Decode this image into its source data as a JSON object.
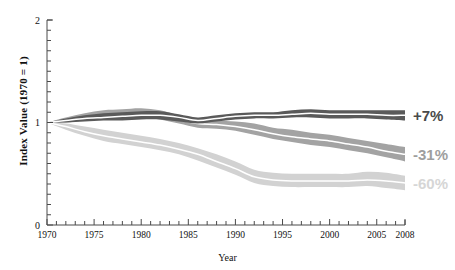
{
  "chart_data": {
    "type": "area",
    "title": "",
    "xlabel": "Year",
    "ylabel": "Index Value (1970 = 1)",
    "xlim": [
      1970,
      2008
    ],
    "ylim": [
      0,
      2
    ],
    "ytick_labels": [
      "0",
      "1",
      "2"
    ],
    "ytick_values": [
      0,
      1,
      2
    ],
    "yminor_step": 0.1,
    "xtick_labels": [
      "1970",
      "1975",
      "1980",
      "1985",
      "1990",
      "1995",
      "2000",
      "2005",
      "2008"
    ],
    "xtick_values": [
      1970,
      1975,
      1980,
      1985,
      1990,
      1995,
      2000,
      2005,
      2008
    ],
    "xminor_step": 1,
    "grid": false,
    "legend_position": "right-inline-end-labels",
    "x": [
      1970,
      1972,
      1974,
      1976,
      1978,
      1980,
      1982,
      1984,
      1986,
      1988,
      1990,
      1992,
      1994,
      1996,
      1998,
      2000,
      2002,
      2004,
      2006,
      2008
    ],
    "series": [
      {
        "name": "+7%",
        "end_label": "+7%",
        "color": "#555555",
        "band_color": "#5a5a5a",
        "center": [
          1.0,
          1.02,
          1.04,
          1.05,
          1.06,
          1.07,
          1.07,
          1.05,
          1.02,
          1.04,
          1.06,
          1.07,
          1.07,
          1.08,
          1.09,
          1.08,
          1.08,
          1.08,
          1.07,
          1.07
        ],
        "upper": [
          1.0,
          1.04,
          1.07,
          1.09,
          1.1,
          1.11,
          1.11,
          1.08,
          1.05,
          1.07,
          1.09,
          1.1,
          1.1,
          1.12,
          1.13,
          1.12,
          1.12,
          1.12,
          1.12,
          1.12
        ],
        "lower": [
          1.0,
          1.0,
          1.01,
          1.02,
          1.02,
          1.03,
          1.03,
          1.01,
          0.99,
          1.01,
          1.03,
          1.04,
          1.04,
          1.05,
          1.05,
          1.04,
          1.04,
          1.04,
          1.03,
          1.02
        ]
      },
      {
        "name": "-31%",
        "end_label": "-31%",
        "color": "#9a9a9a",
        "band_color": "#a3a3a3",
        "center": [
          1.0,
          1.02,
          1.05,
          1.07,
          1.08,
          1.09,
          1.07,
          1.03,
          0.99,
          0.98,
          0.96,
          0.93,
          0.89,
          0.86,
          0.84,
          0.82,
          0.79,
          0.76,
          0.72,
          0.69
        ],
        "upper": [
          1.0,
          1.05,
          1.09,
          1.12,
          1.13,
          1.14,
          1.12,
          1.07,
          1.03,
          1.02,
          1.01,
          0.99,
          0.95,
          0.93,
          0.9,
          0.88,
          0.85,
          0.82,
          0.79,
          0.76
        ],
        "lower": [
          1.0,
          1.0,
          1.02,
          1.03,
          1.04,
          1.05,
          1.03,
          0.99,
          0.95,
          0.94,
          0.92,
          0.88,
          0.84,
          0.81,
          0.78,
          0.76,
          0.73,
          0.7,
          0.66,
          0.62
        ]
      },
      {
        "name": "-60%",
        "end_label": "-60%",
        "color": "#cdcdcd",
        "band_color": "#d2d2d2",
        "center": [
          1.0,
          0.96,
          0.91,
          0.87,
          0.84,
          0.81,
          0.78,
          0.74,
          0.69,
          0.62,
          0.55,
          0.47,
          0.44,
          0.43,
          0.43,
          0.43,
          0.43,
          0.44,
          0.43,
          0.41
        ],
        "upper": [
          1.0,
          0.99,
          0.96,
          0.93,
          0.9,
          0.87,
          0.84,
          0.8,
          0.75,
          0.69,
          0.62,
          0.54,
          0.51,
          0.5,
          0.5,
          0.5,
          0.5,
          0.52,
          0.51,
          0.48
        ],
        "lower": [
          1.0,
          0.93,
          0.87,
          0.82,
          0.79,
          0.76,
          0.73,
          0.69,
          0.63,
          0.56,
          0.49,
          0.41,
          0.38,
          0.37,
          0.37,
          0.37,
          0.37,
          0.38,
          0.36,
          0.34
        ]
      }
    ],
    "end_labels": [
      {
        "text": "+7%",
        "value": 1.07,
        "color": "#4a4a4a"
      },
      {
        "text": "-31%",
        "value": 0.69,
        "color": "#9e9e9e"
      },
      {
        "text": "-60%",
        "value": 0.41,
        "color": "#d6d6d6"
      }
    ]
  }
}
